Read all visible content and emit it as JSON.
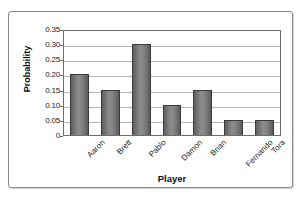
{
  "chart_data": {
    "type": "bar",
    "title": "",
    "subtitle": "",
    "xlabel": "Player",
    "ylabel": "Probability",
    "categories": [
      "Aaron",
      "Brett",
      "Pablo",
      "Damon",
      "Brian",
      "Fernando",
      "Tora"
    ],
    "values": [
      0.2,
      0.15,
      0.3,
      0.1,
      0.15,
      0.05,
      0.05
    ],
    "series": [
      {
        "name": "Probability",
        "values": [
          0.2,
          0.15,
          0.3,
          0.1,
          0.15,
          0.05,
          0.05
        ]
      }
    ],
    "ylim": [
      0,
      0.35
    ],
    "ytick_labels": [
      "0.35",
      "0.30",
      "0.25",
      "0.20",
      "0.15",
      "0.10",
      "0.05",
      "0"
    ],
    "ytick_values": [
      0.35,
      0.3,
      0.25,
      0.2,
      0.15,
      0.1,
      0.05,
      0
    ],
    "grid": "horizontal",
    "legend": "none",
    "legend_position": "none",
    "annotations": [],
    "colors": {
      "bar_fill": "#8c8c8c",
      "bar_edge": "#3b3b3b",
      "gridline": "#b6b6b6",
      "axis_line": "#6d6d6d",
      "frame_border": "#8a8a8a",
      "background": "#ffffff",
      "text": "#1b1b1b"
    }
  }
}
